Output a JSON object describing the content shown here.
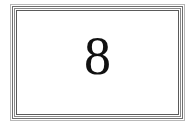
{
  "card": {
    "value": "8"
  }
}
